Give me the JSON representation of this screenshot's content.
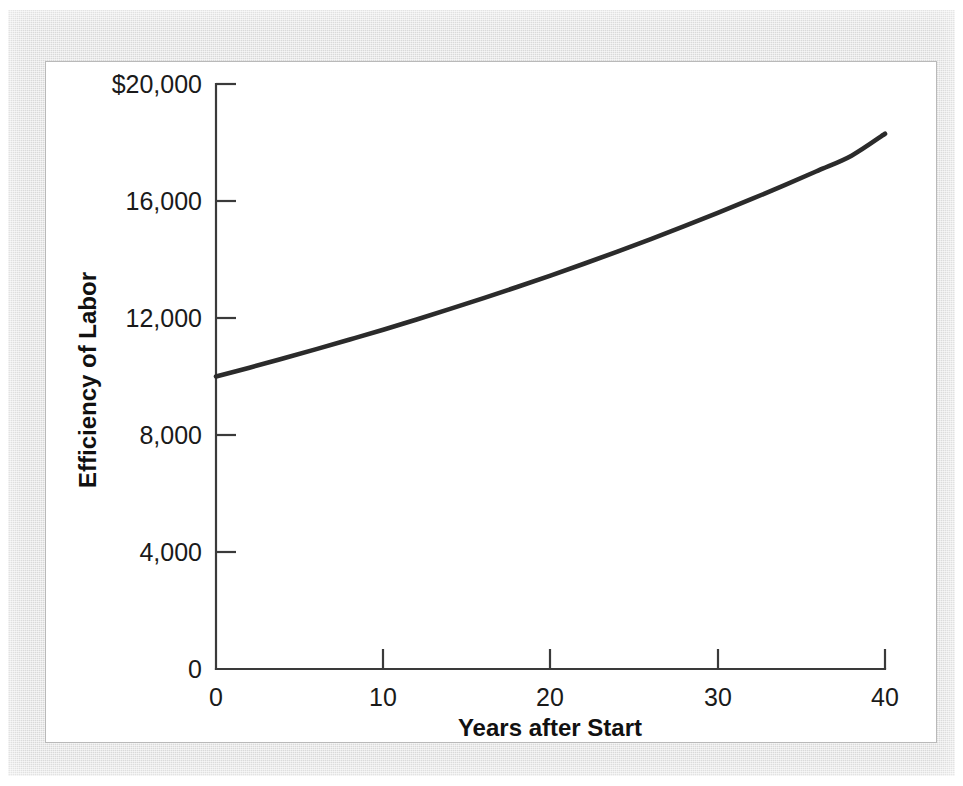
{
  "figure": {
    "panel_background": "#ffffff",
    "mat_background": "#d9d9d9",
    "border_color": "#b9b9b9"
  },
  "chart_data": {
    "type": "line",
    "title": "",
    "subtitle": "",
    "xlabel": "Years after Start",
    "ylabel": "Efficiency of Labor",
    "xlim": [
      0,
      40
    ],
    "ylim": [
      0,
      20000
    ],
    "grid": false,
    "legend": false,
    "legend_position": "none",
    "x_ticks": [
      0,
      10,
      20,
      30,
      40
    ],
    "x_tick_labels": [
      "0",
      "10",
      "20",
      "30",
      "40"
    ],
    "y_ticks": [
      0,
      4000,
      8000,
      12000,
      16000,
      20000
    ],
    "y_tick_labels": [
      "0",
      "4,000",
      "8,000",
      "12,000",
      "16,000",
      "$20,000"
    ],
    "series": [
      {
        "name": "Efficiency of Labor",
        "color": "#2b2b2b",
        "line_width": 4.6,
        "x": [
          0,
          2,
          4,
          6,
          8,
          10,
          12,
          14,
          16,
          18,
          20,
          22,
          24,
          26,
          28,
          30,
          32,
          34,
          36,
          38,
          40
        ],
        "values": [
          10000,
          10300,
          10615,
          10935,
          11265,
          11600,
          11950,
          12310,
          12680,
          13060,
          13450,
          13855,
          14270,
          14700,
          15140,
          15595,
          16060,
          16540,
          17040,
          17550,
          18300
        ]
      }
    ],
    "annotations": []
  },
  "axis_labels": {
    "x_title": "Years after Start",
    "y_title": "Efficiency of Labor"
  }
}
